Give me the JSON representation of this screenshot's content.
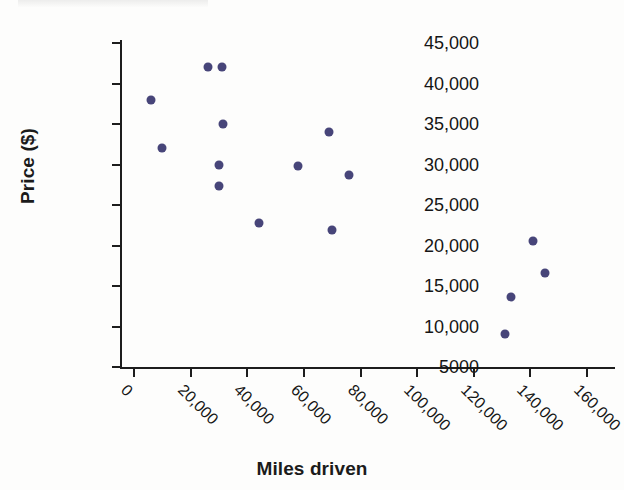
{
  "figure": {
    "xlabel": "Miles driven",
    "ylabel": "Price ($)",
    "point_color": "#474579",
    "axis_color": "#1d1d1d",
    "background": "#fdfdfc"
  },
  "chart_data": {
    "type": "scatter",
    "title": "",
    "xlabel": "Miles driven",
    "ylabel": "Price ($)",
    "xlim": [
      0,
      160000
    ],
    "ylim": [
      5000,
      45000
    ],
    "xticks": [
      0,
      20000,
      40000,
      60000,
      80000,
      100000,
      120000,
      140000,
      160000
    ],
    "xtick_labels": [
      "0",
      "20,000",
      "40,000",
      "60,000",
      "80,000",
      "100,000",
      "120,000",
      "140,000",
      "160,000"
    ],
    "yticks": [
      5000,
      10000,
      15000,
      20000,
      25000,
      30000,
      35000,
      40000,
      45000
    ],
    "ytick_labels": [
      "5000",
      "10,000",
      "15,000",
      "20,000",
      "25,000",
      "30,000",
      "35,000",
      "40,000",
      "45,000"
    ],
    "grid": false,
    "legend": false,
    "marker": "circle",
    "marker_color": "#474579",
    "points": [
      {
        "x": 6000,
        "y": 38000
      },
      {
        "x": 10000,
        "y": 32000
      },
      {
        "x": 26000,
        "y": 42000
      },
      {
        "x": 31000,
        "y": 42000
      },
      {
        "x": 31500,
        "y": 35000
      },
      {
        "x": 30000,
        "y": 30000
      },
      {
        "x": 30000,
        "y": 27400
      },
      {
        "x": 44000,
        "y": 22800
      },
      {
        "x": 58000,
        "y": 29800
      },
      {
        "x": 69000,
        "y": 34000
      },
      {
        "x": 70000,
        "y": 21900
      },
      {
        "x": 76000,
        "y": 28700
      },
      {
        "x": 131000,
        "y": 9100
      },
      {
        "x": 133000,
        "y": 13700
      },
      {
        "x": 141000,
        "y": 20600
      },
      {
        "x": 145000,
        "y": 16600
      }
    ]
  }
}
